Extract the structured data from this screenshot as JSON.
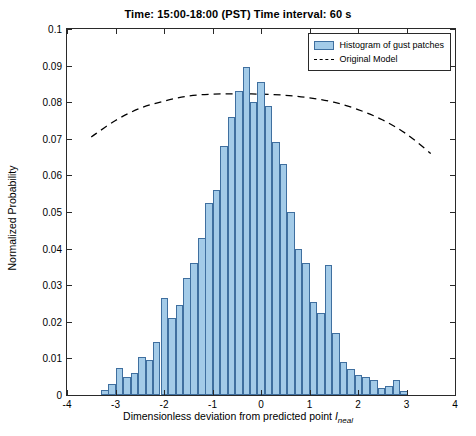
{
  "figure": {
    "title": "Time: 15:00-18:00 (PST)   Time interval: 60 s",
    "xaxis_title_main": "Dimensionless deviation from predicted point ",
    "xaxis_title_var": "I",
    "xaxis_title_sub": "neal",
    "yaxis_title": "Normalized Probability"
  },
  "legend": {
    "items": [
      {
        "label": "Histogram of gust patches",
        "type": "bar",
        "color": "#a3cbe8",
        "edge": "#3f6f9f"
      },
      {
        "label": "Original Model",
        "type": "dashed-line",
        "color": "#000000"
      }
    ]
  },
  "chart_data": {
    "type": "bar",
    "title": "Time: 15:00-18:00 (PST)   Time interval: 60 s",
    "xlabel": "Dimensionless deviation from predicted point I_neal",
    "ylabel": "Normalized Probability",
    "xlim": [
      -4,
      4
    ],
    "ylim": [
      0,
      0.1
    ],
    "xticks": [
      -4,
      -3,
      -2,
      -1,
      0,
      1,
      2,
      3,
      4
    ],
    "yticks": [
      0,
      0.01,
      0.02,
      0.03,
      0.04,
      0.05,
      0.06,
      0.07,
      0.08,
      0.09,
      0.1
    ],
    "ytick_labels": [
      "0",
      "0.01",
      "0.02",
      "0.03",
      "0.04",
      "0.05",
      "0.06",
      "0.07",
      "0.08",
      "0.09",
      "0.1"
    ],
    "grid": false,
    "legend_position": "top-right",
    "bar_width": 0.155,
    "series": [
      {
        "name": "Histogram of gust patches",
        "type": "bar",
        "color": "#a3cbe8",
        "edge_color": "#3f6f9f",
        "x": [
          -3.22,
          -3.07,
          -2.92,
          -2.76,
          -2.61,
          -2.45,
          -2.3,
          -2.15,
          -1.99,
          -1.84,
          -1.68,
          -1.53,
          -1.38,
          -1.22,
          -1.07,
          -0.92,
          -0.76,
          -0.61,
          -0.45,
          -0.3,
          -0.15,
          0.0,
          0.155,
          0.31,
          0.465,
          0.62,
          0.775,
          0.93,
          1.085,
          1.24,
          1.395,
          1.55,
          1.705,
          1.86,
          2.015,
          2.17,
          2.325,
          2.48,
          2.635,
          2.79,
          2.945
        ],
        "values": [
          0.0015,
          0.003,
          0.0075,
          0.005,
          0.006,
          0.0105,
          0.0095,
          0.0145,
          0.0265,
          0.021,
          0.0245,
          0.032,
          0.036,
          0.043,
          0.0525,
          0.056,
          0.068,
          0.076,
          0.083,
          0.0895,
          0.08,
          0.0855,
          0.079,
          0.069,
          0.063,
          0.05,
          0.04,
          0.036,
          0.0255,
          0.0225,
          0.0355,
          0.017,
          0.009,
          0.007,
          0.0055,
          0.005,
          0.004,
          0.002,
          0.0025,
          0.004,
          0.001
        ]
      },
      {
        "name": "Original Model",
        "type": "dashed-line",
        "color": "#000000",
        "x": [
          -3.5,
          -3.0,
          -2.5,
          -2.0,
          -1.5,
          -1.0,
          -0.5,
          0.0,
          0.5,
          1.0,
          1.5,
          2.0,
          2.5,
          3.0,
          3.5
        ],
        "values": [
          0.0705,
          0.075,
          0.0783,
          0.0803,
          0.0817,
          0.0822,
          0.0823,
          0.0822,
          0.0819,
          0.0812,
          0.08,
          0.078,
          0.0752,
          0.0713,
          0.066
        ]
      }
    ]
  }
}
